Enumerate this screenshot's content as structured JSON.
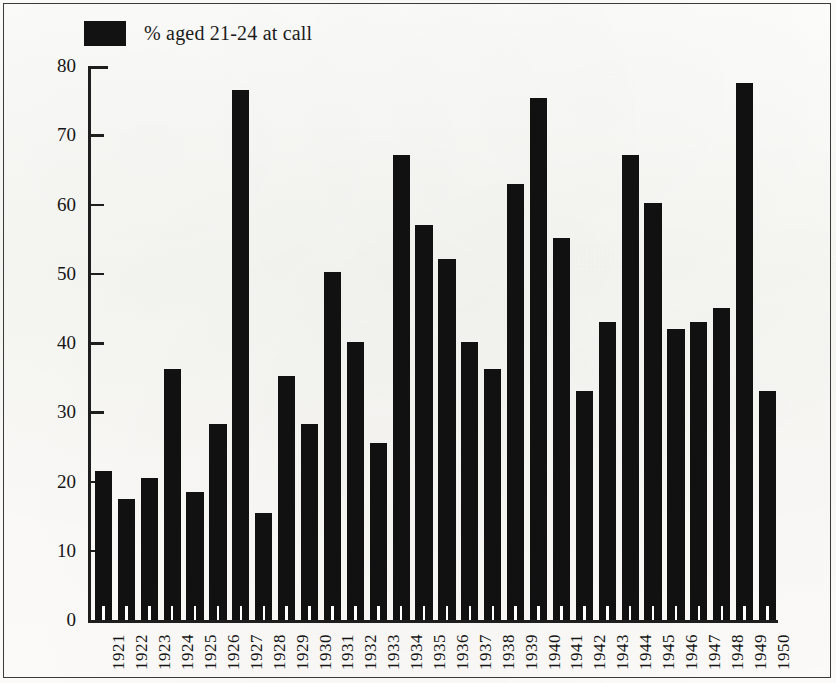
{
  "figure": {
    "background_color": "#fbfbf9",
    "bar_color": "#111111",
    "axis_color": "#1e1e1e",
    "border_color": "#3a3a3a"
  },
  "legend": {
    "swatch_name": "legend-swatch-black",
    "label": "% aged 21-24 at call"
  },
  "chart_data": {
    "type": "bar",
    "title": "",
    "subtitle": "",
    "xlabel": "",
    "ylabel": "",
    "ylim": [
      0,
      80
    ],
    "xlim_categories": 30,
    "grid": false,
    "legend_position": "top-left",
    "y_ticks": [
      0,
      10,
      20,
      30,
      40,
      50,
      60,
      70,
      80
    ],
    "y_tick_labels": [
      "0",
      "10",
      "20",
      "30",
      "40",
      "50",
      "60",
      "70",
      "80"
    ],
    "categories": [
      "1921",
      "1922",
      "1923",
      "1924",
      "1925",
      "1926",
      "1927",
      "1928",
      "1929",
      "1930",
      "1931",
      "1932",
      "1933",
      "1934",
      "1935",
      "1936",
      "1937",
      "1938",
      "1939",
      "1940",
      "1941",
      "1942",
      "1943",
      "1944",
      "1945",
      "1946",
      "1947",
      "1948",
      "1949",
      "1950"
    ],
    "series": [
      {
        "name": "% aged 21-24 at call",
        "color": "#111111",
        "values": [
          21.5,
          17.5,
          20.5,
          36.2,
          18.5,
          28.3,
          76.5,
          15.5,
          35.2,
          28.3,
          50.2,
          40.2,
          25.5,
          67.2,
          57.0,
          52.2,
          40.2,
          36.2,
          63.0,
          75.4,
          55.2,
          33.0,
          43.0,
          67.1,
          60.2,
          42.0,
          43.0,
          45.0,
          77.5,
          33.0
        ]
      }
    ]
  }
}
